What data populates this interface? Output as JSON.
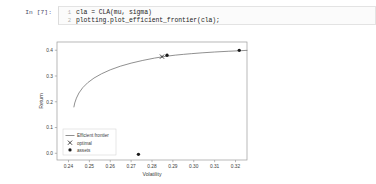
{
  "notebook": {
    "prompt": "In [7]:",
    "code_lines": [
      {
        "number": "1",
        "text": "cla = CLA(mu, sigma)"
      },
      {
        "number": "2",
        "text": "plotting.plot_efficient_frontier(cla);"
      }
    ]
  },
  "colors": {
    "line": "#6b6b6b",
    "marker": "#1a1a1a",
    "axis": "#9a9a9a",
    "text": "#3c3c3c",
    "background": "#ffffff"
  },
  "chart_data": {
    "type": "line",
    "title": "",
    "xlabel": "Volatility",
    "ylabel": "Return",
    "xlim": [
      0.2345,
      0.3255
    ],
    "ylim": [
      -0.026,
      0.432
    ],
    "xticks": [
      "0.24",
      "0.25",
      "0.26",
      "0.27",
      "0.28",
      "0.29",
      "0.30",
      "0.31",
      "0.32"
    ],
    "xtick_values": [
      0.24,
      0.25,
      0.26,
      0.27,
      0.28,
      0.29,
      0.3,
      0.31,
      0.32
    ],
    "yticks": [
      "0.0",
      "0.1",
      "0.2",
      "0.3",
      "0.4"
    ],
    "ytick_values": [
      0.0,
      0.1,
      0.2,
      0.3,
      0.4
    ],
    "grid": false,
    "legend_position": "lower left",
    "legend": [
      {
        "label": "Efficient frontier",
        "marker": "line"
      },
      {
        "label": "optimal",
        "marker": "x"
      },
      {
        "label": "assets",
        "marker": "dot"
      }
    ],
    "series": [
      {
        "name": "Efficient frontier",
        "type": "line",
        "x": [
          0.2426,
          0.243,
          0.2438,
          0.245,
          0.2468,
          0.2492,
          0.2522,
          0.2558,
          0.26,
          0.2648,
          0.27,
          0.2756,
          0.2812,
          0.2866,
          0.2912,
          0.295,
          0.299,
          0.304,
          0.31,
          0.3165,
          0.323,
          0.3255
        ],
        "y": [
          0.18,
          0.1955,
          0.214,
          0.234,
          0.2545,
          0.274,
          0.292,
          0.3085,
          0.324,
          0.338,
          0.35,
          0.3605,
          0.3695,
          0.3765,
          0.381,
          0.384,
          0.3868,
          0.39,
          0.3932,
          0.396,
          0.3985,
          0.3996
        ]
      },
      {
        "name": "optimal",
        "type": "scatter",
        "marker": "x",
        "x": [
          0.2848
        ],
        "y": [
          0.3752
        ]
      },
      {
        "name": "assets",
        "type": "scatter",
        "marker": "dot",
        "x": [
          0.2872,
          0.3218,
          0.2735
        ],
        "y": [
          0.3805,
          0.3998,
          -0.004
        ]
      }
    ]
  }
}
